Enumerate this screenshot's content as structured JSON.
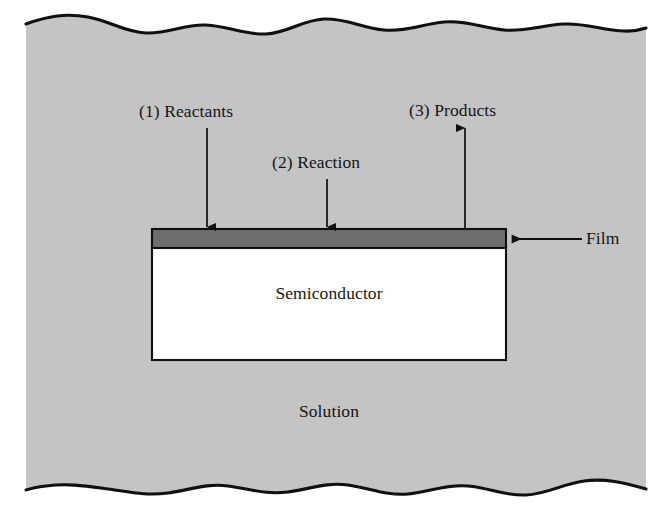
{
  "figure": {
    "type": "cross-section-schematic",
    "labels": {
      "reactants": "(1) Reactants",
      "reaction": "(2) Reaction",
      "products": "(3) Products",
      "film": "Film",
      "semiconductor": "Semiconductor",
      "solution": "Solution"
    },
    "steps": [
      {
        "number": "(1)",
        "name": "Reactants",
        "arrow_direction": "down"
      },
      {
        "number": "(2)",
        "name": "Reaction",
        "arrow_direction": "down"
      },
      {
        "number": "(3)",
        "name": "Products",
        "arrow_direction": "up"
      }
    ],
    "regions": [
      {
        "name": "Solution",
        "fill": "#c4c4c4",
        "edge": "wavy-top-and-bottom"
      },
      {
        "name": "Film",
        "fill": "#6e6e6e"
      },
      {
        "name": "Semiconductor",
        "fill": "#ffffff"
      }
    ],
    "colors": {
      "solution_fill": "#c4c4c4",
      "film_fill": "#6e6e6e",
      "semiconductor_fill": "#ffffff",
      "outline": "#101010",
      "page_background": "#ffffff",
      "text": "#151515"
    },
    "icons": {
      "arrow_down_reactants": "arrow-down-icon",
      "arrow_down_reaction": "arrow-down-icon",
      "arrow_up_products": "arrow-up-icon",
      "arrow_left_film": "arrow-left-icon"
    }
  }
}
